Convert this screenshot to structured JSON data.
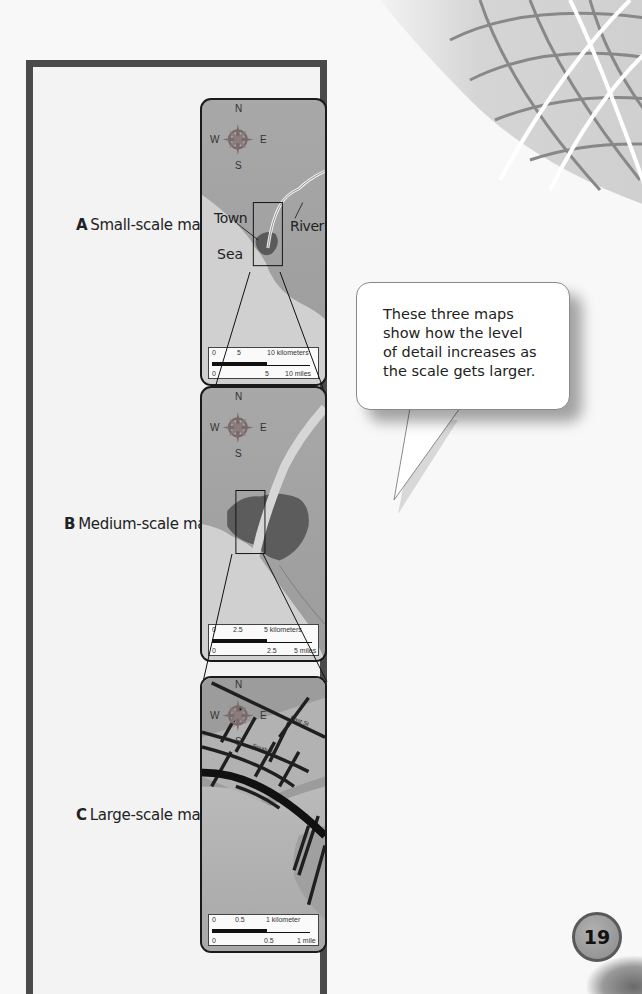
{
  "maps": [
    {
      "letter": "A",
      "title": "Small-scale map",
      "compass": {
        "n": "N",
        "s": "S",
        "e": "E",
        "w": "W"
      },
      "labels": {
        "town": "Town",
        "river": "River",
        "sea": "Sea"
      },
      "scale": {
        "top_0": "0",
        "top_mid": "5",
        "top_end": "10 kilometers",
        "bottom_0": "0",
        "bottom_mid": "5",
        "bottom_end": "10 miles"
      }
    },
    {
      "letter": "B",
      "title": "Medium-scale map",
      "compass": {
        "n": "N",
        "s": "S",
        "e": "E",
        "w": "W"
      },
      "scale": {
        "top_0": "0",
        "top_mid": "2.5",
        "top_end": "5 kilometers",
        "bottom_0": "0",
        "bottom_mid": "2.5",
        "bottom_end": "5 miles"
      }
    },
    {
      "letter": "C",
      "title": "Large-scale map",
      "compass": {
        "n": "N",
        "s": "S",
        "e": "E",
        "w": "W"
      },
      "streets": {
        "east": "East St",
        "south": "South St"
      },
      "scale": {
        "top_0": "0",
        "top_mid": "0.5",
        "top_end": "1 kilometer",
        "bottom_0": "0",
        "bottom_mid": "0.5",
        "bottom_end": "1 mile"
      }
    }
  ],
  "bubble": {
    "lines": [
      "These three maps",
      "show how the level",
      "of detail increases as",
      "the scale gets larger."
    ]
  },
  "page_number": "19",
  "colors": {
    "frame": "#4a4a4a",
    "land": "#9e9e9e",
    "sea": "#d2d2d2",
    "town": "#555555",
    "compass": "#7a6a6a"
  }
}
